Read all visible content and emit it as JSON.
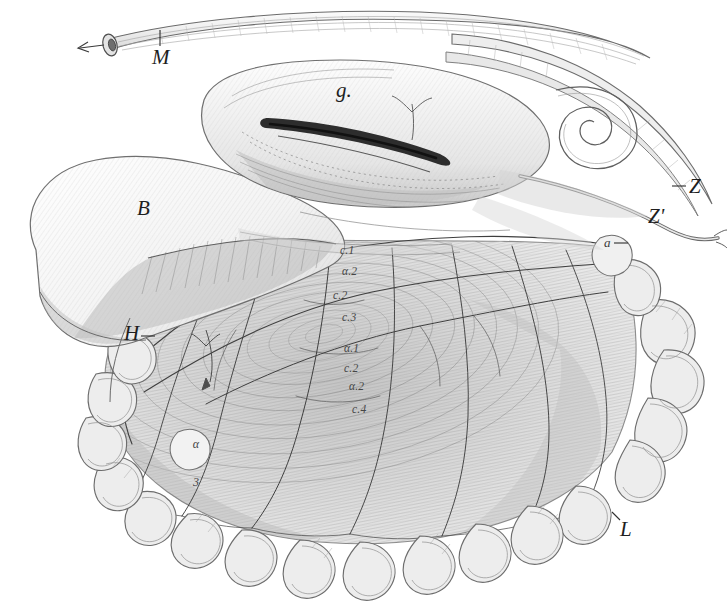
{
  "plate": {
    "kind": "anatomical-engraving",
    "subject": "Abdominal viscera: stomach, duodenum, mesentery and intestinal loops",
    "style": "19th-century steel engraving, fine line hatching, monochrome",
    "width": 727,
    "height": 613,
    "background_color": "#ffffff",
    "ink_color": "#2b2b2b",
    "mid_tone": "#9a9a9a",
    "light_tone": "#d8d8d8"
  },
  "labels": [
    {
      "id": "M",
      "text": "M",
      "class": "major",
      "x": 152,
      "y": 47,
      "tick": {
        "x1": 160,
        "y1": 32,
        "x2": 160,
        "y2": 48
      }
    },
    {
      "id": "g",
      "text": "g.",
      "class": "major",
      "x": 336,
      "y": 80,
      "tick": null
    },
    {
      "id": "B",
      "text": "B",
      "class": "major",
      "x": 137,
      "y": 198,
      "tick": null
    },
    {
      "id": "H",
      "text": "H",
      "class": "major",
      "x": 124,
      "y": 323,
      "tick": {
        "x1": 141,
        "y1": 337,
        "x2": 153,
        "y2": 337
      }
    },
    {
      "id": "Z",
      "text": "Z",
      "class": "major",
      "x": 689,
      "y": 176,
      "tick": {
        "x1": 672,
        "y1": 188,
        "x2": 686,
        "y2": 188
      }
    },
    {
      "id": "Zprime",
      "text": "Z'",
      "class": "major",
      "x": 648,
      "y": 206,
      "tick": null
    },
    {
      "id": "L",
      "text": "L",
      "class": "major",
      "x": 620,
      "y": 519,
      "tick": null
    },
    {
      "id": "a",
      "text": "a",
      "class": "minor",
      "x": 604,
      "y": 236,
      "tick": {
        "x1": 616,
        "y1": 244,
        "x2": 628,
        "y2": 244
      }
    },
    {
      "id": "c1",
      "text": "c.1",
      "class": "tiny",
      "x": 340,
      "y": 245,
      "tick": null
    },
    {
      "id": "alpha2a",
      "text": "α.2",
      "class": "tiny",
      "x": 342,
      "y": 266,
      "tick": null
    },
    {
      "id": "c2a",
      "text": "c.2",
      "class": "tiny",
      "x": 333,
      "y": 290,
      "tick": null
    },
    {
      "id": "c3",
      "text": "c.3",
      "class": "tiny",
      "x": 342,
      "y": 312,
      "tick": null
    },
    {
      "id": "alpha1",
      "text": "α.1",
      "class": "tiny",
      "x": 344,
      "y": 343,
      "tick": null
    },
    {
      "id": "c2b",
      "text": "c.2",
      "class": "tiny",
      "x": 344,
      "y": 363,
      "tick": null
    },
    {
      "id": "alpha2b",
      "text": "α.2",
      "class": "tiny",
      "x": 349,
      "y": 381,
      "tick": null
    },
    {
      "id": "c4",
      "text": "c.4",
      "class": "tiny",
      "x": 352,
      "y": 404,
      "tick": null
    }
  ],
  "stacked_labels": [
    {
      "id": "alpha3",
      "line1": "α",
      "line2": "3",
      "x": 190,
      "y": 413
    }
  ],
  "structures": [
    {
      "id": "duodenum-tube",
      "name": "duodenum-tube",
      "label_ref": "M"
    },
    {
      "id": "pylorus-incision",
      "name": "pylorus-incision",
      "label_ref": "g"
    },
    {
      "id": "stomach-body",
      "name": "stomach-body",
      "label_ref": "B"
    },
    {
      "id": "mesentery-fan",
      "name": "mesentery-fan",
      "label_ref": "H"
    },
    {
      "id": "coiled-intestine",
      "name": "coiled-intestine",
      "label_ref": "Z"
    },
    {
      "id": "intestinal-loops",
      "name": "intestinal-loops",
      "label_ref": "L"
    },
    {
      "id": "vascular-arcade",
      "name": "vascular-arcade",
      "label_ref": "a"
    }
  ]
}
